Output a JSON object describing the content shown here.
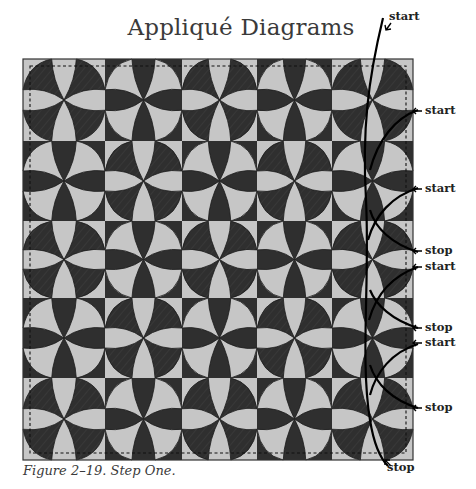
{
  "figure": {
    "title": "Appliqué Diagrams",
    "caption": "Figure 2–19. Step One."
  },
  "quilt": {
    "x": 23,
    "y": 59,
    "col_edges": [
      23,
      105,
      182,
      257,
      332,
      413
    ],
    "row_edges": [
      59,
      141,
      221,
      298,
      378,
      460
    ],
    "pattern": "checkerboard, top-left block light",
    "block_grid": [
      [
        "light",
        "dark",
        "light",
        "dark",
        "light"
      ],
      [
        "dark",
        "light",
        "dark",
        "light",
        "dark"
      ],
      [
        "light",
        "dark",
        "light",
        "dark",
        "light"
      ],
      [
        "dark",
        "light",
        "dark",
        "light",
        "dark"
      ],
      [
        "light",
        "dark",
        "light",
        "dark",
        "light"
      ]
    ],
    "dashed_inset": 7
  },
  "colors": {
    "light": "#c6c6c6",
    "dark": "#2f2f2f",
    "outline": "#1a1a1a",
    "hatch": "#555555",
    "text": "#222222"
  },
  "stitch_labels": [
    {
      "text": "start",
      "x": 389,
      "y": 9,
      "arrow": "down-left"
    },
    {
      "text": "start",
      "x": 425,
      "y": 103,
      "arrow": "left"
    },
    {
      "text": "start",
      "x": 425,
      "y": 181,
      "arrow": "left"
    },
    {
      "text": "stop",
      "x": 425,
      "y": 243,
      "arrow": "left"
    },
    {
      "text": "start",
      "x": 425,
      "y": 259,
      "arrow": "left"
    },
    {
      "text": "stop",
      "x": 425,
      "y": 320,
      "arrow": "left"
    },
    {
      "text": "start",
      "x": 425,
      "y": 335,
      "arrow": "left"
    },
    {
      "text": "stop",
      "x": 425,
      "y": 400,
      "arrow": "left"
    },
    {
      "text": "stop",
      "x": 387,
      "y": 460,
      "arrow": "up-left"
    }
  ]
}
